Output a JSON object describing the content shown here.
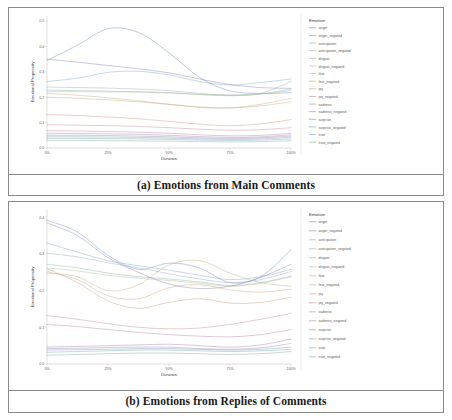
{
  "figures": [
    {
      "id": "a",
      "caption": "(a) Emotions from Main Comments"
    },
    {
      "id": "b",
      "caption": "(b) Emotions from Replies of Comments"
    }
  ],
  "legend": {
    "title": "Emotion",
    "entries": [
      {
        "label": "anger",
        "color": "#6b8fbd"
      },
      {
        "label": "anger_negated",
        "color": "#8c7fb8"
      },
      {
        "label": "anticipation",
        "color": "#7fa9c9"
      },
      {
        "label": "anticipation_negated",
        "color": "#9aa7c4"
      },
      {
        "label": "disgust",
        "color": "#8fb3a6"
      },
      {
        "label": "disgust_negated",
        "color": "#a8bd94"
      },
      {
        "label": "fear",
        "color": "#b9b583"
      },
      {
        "label": "fear_negated",
        "color": "#c5a97e"
      },
      {
        "label": "joy",
        "color": "#c99a84"
      },
      {
        "label": "joy_negated",
        "color": "#c58c92"
      },
      {
        "label": "sadness",
        "color": "#b985a5"
      },
      {
        "label": "sadness_negated",
        "color": "#a583b0"
      },
      {
        "label": "surprise",
        "color": "#8e8fb5"
      },
      {
        "label": "surprise_negated",
        "color": "#7f9ab9"
      },
      {
        "label": "trust",
        "color": "#76a8ad"
      },
      {
        "label": "trust_negated",
        "color": "#7fb096"
      }
    ]
  },
  "chart_data": [
    {
      "type": "line",
      "title": "(a) Emotions from Main Comments",
      "xlabel": "Duration",
      "ylabel": "Emotional Propensity",
      "x": [
        0,
        12.5,
        25,
        37.5,
        50,
        62.5,
        75,
        87.5,
        100
      ],
      "xticklabels": [
        "0%",
        "25%",
        "50%",
        "75%",
        "100%"
      ],
      "xtickvalues": [
        0,
        25,
        50,
        75,
        100
      ],
      "yticklabels": [
        "0.0",
        "0.1",
        "0.2",
        "0.3",
        "0.4",
        "0.5"
      ],
      "ytickvalues": [
        0.0,
        0.1,
        0.2,
        0.3,
        0.4,
        0.5
      ],
      "xlim": [
        0,
        100
      ],
      "ylim": [
        0.0,
        0.52
      ],
      "grid": false,
      "legend_position": "right",
      "series": [
        {
          "name": "anger",
          "values": [
            0.345,
            0.405,
            0.47,
            0.455,
            0.375,
            0.278,
            0.225,
            0.215,
            0.218
          ]
        },
        {
          "name": "anger_negated",
          "values": [
            0.35,
            0.338,
            0.325,
            0.312,
            0.296,
            0.272,
            0.25,
            0.238,
            0.235
          ]
        },
        {
          "name": "anticipation",
          "values": [
            0.262,
            0.275,
            0.298,
            0.302,
            0.288,
            0.262,
            0.248,
            0.258,
            0.272
          ]
        },
        {
          "name": "anticipation_negated",
          "values": [
            0.24,
            0.238,
            0.236,
            0.232,
            0.226,
            0.215,
            0.208,
            0.215,
            0.262
          ]
        },
        {
          "name": "disgust",
          "values": [
            0.228,
            0.226,
            0.224,
            0.222,
            0.218,
            0.21,
            0.206,
            0.212,
            0.232
          ]
        },
        {
          "name": "disgust_negated",
          "values": [
            0.222,
            0.222,
            0.221,
            0.22,
            0.217,
            0.212,
            0.209,
            0.214,
            0.226
          ]
        },
        {
          "name": "fear",
          "values": [
            0.215,
            0.208,
            0.198,
            0.186,
            0.172,
            0.16,
            0.158,
            0.172,
            0.196
          ]
        },
        {
          "name": "fear_negated",
          "values": [
            0.2,
            0.196,
            0.19,
            0.182,
            0.172,
            0.162,
            0.158,
            0.166,
            0.182
          ]
        },
        {
          "name": "joy",
          "values": [
            0.132,
            0.128,
            0.122,
            0.115,
            0.105,
            0.094,
            0.088,
            0.095,
            0.112
          ]
        },
        {
          "name": "joy_negated",
          "values": [
            0.092,
            0.09,
            0.088,
            0.085,
            0.08,
            0.074,
            0.07,
            0.072,
            0.08
          ]
        },
        {
          "name": "sadness",
          "values": [
            0.068,
            0.067,
            0.065,
            0.062,
            0.058,
            0.052,
            0.048,
            0.05,
            0.058
          ]
        },
        {
          "name": "sadness_negated",
          "values": [
            0.058,
            0.057,
            0.056,
            0.054,
            0.05,
            0.045,
            0.042,
            0.044,
            0.052
          ]
        },
        {
          "name": "surprise",
          "values": [
            0.05,
            0.05,
            0.049,
            0.047,
            0.044,
            0.04,
            0.038,
            0.04,
            0.047
          ]
        },
        {
          "name": "surprise_negated",
          "values": [
            0.044,
            0.044,
            0.043,
            0.042,
            0.039,
            0.036,
            0.034,
            0.036,
            0.042
          ]
        },
        {
          "name": "trust",
          "values": [
            0.038,
            0.038,
            0.037,
            0.036,
            0.034,
            0.031,
            0.03,
            0.031,
            0.036
          ]
        },
        {
          "name": "trust_negated",
          "values": [
            0.03,
            0.03,
            0.029,
            0.028,
            0.027,
            0.025,
            0.024,
            0.025,
            0.029
          ]
        }
      ]
    },
    {
      "type": "line",
      "title": "(b) Emotions from Replies of Comments",
      "xlabel": "Duration",
      "ylabel": "Emotional Propensity",
      "x": [
        0,
        12.5,
        25,
        37.5,
        50,
        62.5,
        75,
        87.5,
        100
      ],
      "xticklabels": [
        "0%",
        "25%",
        "50%",
        "75%",
        "100%"
      ],
      "xtickvalues": [
        0,
        25,
        50,
        75,
        100
      ],
      "yticklabels": [
        "0.0",
        "0.1",
        "0.2",
        "0.3",
        "0.4"
      ],
      "ytickvalues": [
        0.0,
        0.1,
        0.2,
        0.3,
        0.4
      ],
      "xlim": [
        0,
        100
      ],
      "ylim": [
        0.0,
        0.42
      ],
      "grid": false,
      "legend_position": "right",
      "series": [
        {
          "name": "anger",
          "values": [
            0.392,
            0.36,
            0.296,
            0.258,
            0.275,
            0.262,
            0.222,
            0.238,
            0.312
          ]
        },
        {
          "name": "anger_negated",
          "values": [
            0.385,
            0.35,
            0.29,
            0.25,
            0.218,
            0.206,
            0.212,
            0.236,
            0.272
          ]
        },
        {
          "name": "anticipation",
          "values": [
            0.33,
            0.305,
            0.282,
            0.268,
            0.256,
            0.242,
            0.23,
            0.238,
            0.258
          ]
        },
        {
          "name": "anticipation_negated",
          "values": [
            0.302,
            0.292,
            0.276,
            0.262,
            0.246,
            0.232,
            0.222,
            0.23,
            0.252
          ]
        },
        {
          "name": "disgust",
          "values": [
            0.272,
            0.262,
            0.248,
            0.238,
            0.232,
            0.224,
            0.214,
            0.222,
            0.24
          ]
        },
        {
          "name": "disgust_negated",
          "values": [
            0.262,
            0.254,
            0.242,
            0.234,
            0.228,
            0.22,
            0.212,
            0.22,
            0.238
          ]
        },
        {
          "name": "fear",
          "values": [
            0.248,
            0.238,
            0.2,
            0.216,
            0.27,
            0.282,
            0.248,
            0.222,
            0.212
          ]
        },
        {
          "name": "fear_negated",
          "values": [
            0.252,
            0.23,
            0.186,
            0.178,
            0.208,
            0.216,
            0.202,
            0.196,
            0.204
          ]
        },
        {
          "name": "joy",
          "values": [
            0.26,
            0.222,
            0.172,
            0.152,
            0.168,
            0.178,
            0.166,
            0.168,
            0.182
          ]
        },
        {
          "name": "joy_negated",
          "values": [
            0.132,
            0.122,
            0.11,
            0.1,
            0.096,
            0.098,
            0.108,
            0.122,
            0.138
          ]
        },
        {
          "name": "sadness",
          "values": [
            0.108,
            0.102,
            0.094,
            0.086,
            0.08,
            0.076,
            0.074,
            0.08,
            0.094
          ]
        },
        {
          "name": "sadness_negated",
          "values": [
            0.046,
            0.048,
            0.05,
            0.052,
            0.054,
            0.05,
            0.046,
            0.052,
            0.068
          ]
        },
        {
          "name": "surprise",
          "values": [
            0.042,
            0.043,
            0.045,
            0.046,
            0.046,
            0.042,
            0.04,
            0.044,
            0.056
          ]
        },
        {
          "name": "surprise_negated",
          "values": [
            0.038,
            0.039,
            0.04,
            0.042,
            0.042,
            0.04,
            0.038,
            0.04,
            0.046
          ]
        },
        {
          "name": "trust",
          "values": [
            0.032,
            0.034,
            0.036,
            0.038,
            0.038,
            0.036,
            0.034,
            0.036,
            0.04
          ]
        },
        {
          "name": "trust_negated",
          "values": [
            0.024,
            0.026,
            0.028,
            0.03,
            0.03,
            0.028,
            0.026,
            0.028,
            0.034
          ]
        }
      ]
    }
  ]
}
